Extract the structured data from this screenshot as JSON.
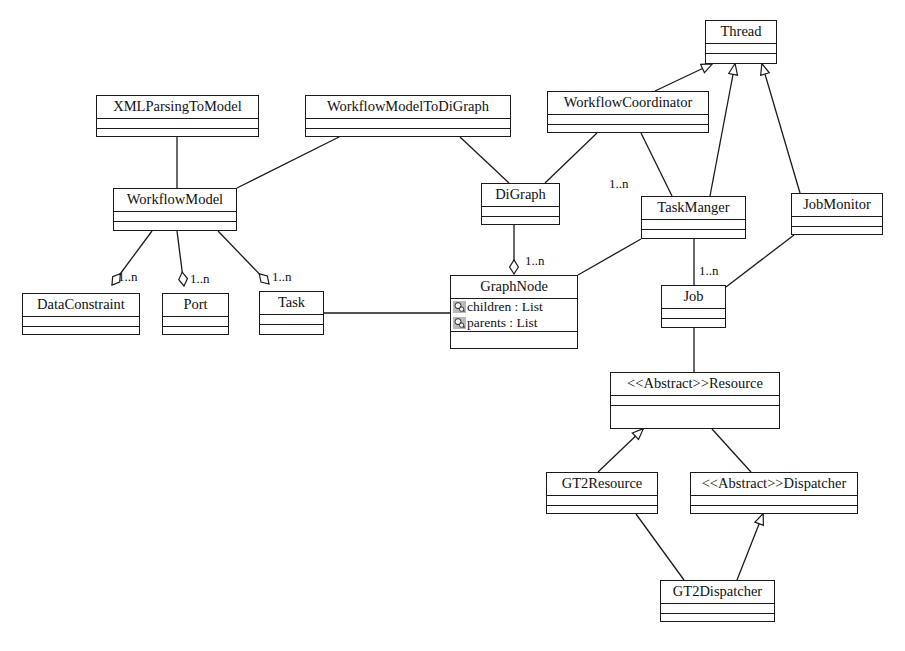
{
  "diagram": {
    "type": "uml-class-diagram",
    "background_color": "#ffffff",
    "line_color": "#1a1a1a",
    "text_color": "#111111"
  },
  "classes": [
    {
      "id": "thread",
      "name": "Thread",
      "x": 705,
      "y": 20,
      "w": 72,
      "h": 44,
      "attributes": [],
      "operations": []
    },
    {
      "id": "xmlparsingtomodel",
      "name": "XMLParsingToModel",
      "x": 96,
      "y": 95,
      "w": 163,
      "h": 42,
      "attributes": [],
      "operations": []
    },
    {
      "id": "workflowmodeltodigraph",
      "name": "WorkflowModelToDiGraph",
      "x": 305,
      "y": 95,
      "w": 206,
      "h": 42,
      "attributes": [],
      "operations": []
    },
    {
      "id": "workflowcoordinator",
      "name": "WorkflowCoordinator",
      "x": 547,
      "y": 91,
      "w": 162,
      "h": 42,
      "attributes": [],
      "operations": []
    },
    {
      "id": "workflowmodel",
      "name": "WorkflowModel",
      "x": 113,
      "y": 188,
      "w": 124,
      "h": 43,
      "attributes": [],
      "operations": []
    },
    {
      "id": "digraph",
      "name": "DiGraph",
      "x": 481,
      "y": 183,
      "w": 79,
      "h": 42,
      "attributes": [],
      "operations": []
    },
    {
      "id": "taskmanger",
      "name": "TaskManger",
      "x": 641,
      "y": 196,
      "w": 105,
      "h": 43,
      "attributes": [],
      "operations": []
    },
    {
      "id": "jobmonitor",
      "name": "JobMonitor",
      "x": 791,
      "y": 193,
      "w": 92,
      "h": 42,
      "attributes": [],
      "operations": []
    },
    {
      "id": "dataconstraint",
      "name": "DataConstraint",
      "x": 22,
      "y": 293,
      "w": 118,
      "h": 42,
      "attributes": [],
      "operations": []
    },
    {
      "id": "port",
      "name": "Port",
      "x": 162,
      "y": 293,
      "w": 67,
      "h": 42,
      "attributes": [],
      "operations": []
    },
    {
      "id": "task",
      "name": "Task",
      "x": 259,
      "y": 291,
      "w": 65,
      "h": 44,
      "attributes": [],
      "operations": []
    },
    {
      "id": "graphnode",
      "name": "GraphNode",
      "x": 450,
      "y": 275,
      "w": 128,
      "h": 74,
      "attributes": [
        {
          "icon": "private-attribute-icon",
          "text": "children : List"
        },
        {
          "icon": "private-attribute-icon",
          "text": "parents : List"
        }
      ],
      "operations": []
    },
    {
      "id": "job",
      "name": "Job",
      "x": 661,
      "y": 285,
      "w": 65,
      "h": 43,
      "attributes": [],
      "operations": []
    },
    {
      "id": "resource",
      "name": "<<Abstract>>Resource",
      "x": 610,
      "y": 372,
      "w": 170,
      "h": 57,
      "attributes": [],
      "operations": []
    },
    {
      "id": "gt2resource",
      "name": "GT2Resource",
      "x": 546,
      "y": 472,
      "w": 112,
      "h": 42,
      "attributes": [],
      "operations": []
    },
    {
      "id": "dispatcher",
      "name": "<<Abstract>>Dispatcher",
      "x": 690,
      "y": 472,
      "w": 168,
      "h": 42,
      "attributes": [],
      "operations": []
    },
    {
      "id": "gt2dispatcher",
      "name": "GT2Dispatcher",
      "x": 660,
      "y": 580,
      "w": 115,
      "h": 42,
      "attributes": [],
      "operations": []
    }
  ],
  "multiplicity_labels": [
    {
      "id": "mult-workflowmodel-dataconstraint",
      "text": "1..n",
      "x": 118,
      "y": 270
    },
    {
      "id": "mult-workflowmodel-port",
      "text": "1..n",
      "x": 190,
      "y": 272
    },
    {
      "id": "mult-workflowmodel-task",
      "text": "1..n",
      "x": 272,
      "y": 270
    },
    {
      "id": "mult-digraph-graphnode",
      "text": "1..n",
      "x": 525,
      "y": 254
    },
    {
      "id": "mult-coordinator-taskmanger",
      "text": "1..n",
      "x": 609,
      "y": 177
    },
    {
      "id": "mult-taskmanger-job",
      "text": "1..n",
      "x": 699,
      "y": 264
    }
  ],
  "relationships": [
    {
      "id": "rel-xmlparsing-workflowmodel",
      "type": "association",
      "from": "xmlparsingtomodel",
      "to": "workflowmodel"
    },
    {
      "id": "rel-workflowmodeltodigraph-workflowmodel",
      "type": "association",
      "from": "workflowmodeltodigraph",
      "to": "workflowmodel"
    },
    {
      "id": "rel-workflowmodeltodigraph-digraph",
      "type": "association",
      "from": "workflowmodeltodigraph",
      "to": "digraph"
    },
    {
      "id": "rel-coordinator-digraph",
      "type": "association",
      "from": "workflowcoordinator",
      "to": "digraph"
    },
    {
      "id": "rel-coordinator-taskmanger",
      "type": "association",
      "from": "workflowcoordinator",
      "to": "taskmanger"
    },
    {
      "id": "rel-coordinator-thread",
      "type": "generalization",
      "from": "workflowcoordinator",
      "to": "thread"
    },
    {
      "id": "rel-taskmanger-thread",
      "type": "generalization",
      "from": "taskmanger",
      "to": "thread"
    },
    {
      "id": "rel-jobmonitor-thread",
      "type": "generalization",
      "from": "jobmonitor",
      "to": "thread"
    },
    {
      "id": "rel-workflowmodel-dataconstraint",
      "type": "aggregation",
      "from": "workflowmodel",
      "to": "dataconstraint"
    },
    {
      "id": "rel-workflowmodel-port",
      "type": "aggregation",
      "from": "workflowmodel",
      "to": "port"
    },
    {
      "id": "rel-workflowmodel-task",
      "type": "aggregation",
      "from": "workflowmodel",
      "to": "task"
    },
    {
      "id": "rel-digraph-graphnode",
      "type": "aggregation",
      "from": "digraph",
      "to": "graphnode"
    },
    {
      "id": "rel-task-graphnode",
      "type": "association",
      "from": "task",
      "to": "graphnode"
    },
    {
      "id": "rel-graphnode-taskmanger",
      "type": "association",
      "from": "graphnode",
      "to": "taskmanger"
    },
    {
      "id": "rel-taskmanger-job",
      "type": "association",
      "from": "taskmanger",
      "to": "job"
    },
    {
      "id": "rel-jobmonitor-job",
      "type": "association",
      "from": "jobmonitor",
      "to": "job"
    },
    {
      "id": "rel-job-resource",
      "type": "association",
      "from": "job",
      "to": "resource"
    },
    {
      "id": "rel-gt2resource-resource",
      "type": "generalization",
      "from": "gt2resource",
      "to": "resource"
    },
    {
      "id": "rel-dispatcher-resource",
      "type": "association",
      "from": "dispatcher",
      "to": "resource"
    },
    {
      "id": "rel-gt2dispatcher-gt2resource",
      "type": "association",
      "from": "gt2dispatcher",
      "to": "gt2resource"
    },
    {
      "id": "rel-gt2dispatcher-dispatcher",
      "type": "generalization",
      "from": "gt2dispatcher",
      "to": "dispatcher"
    }
  ]
}
